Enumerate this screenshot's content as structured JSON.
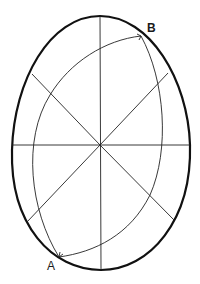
{
  "diagram": {
    "type": "egg-geometry",
    "labels": {
      "point_b": "B",
      "point_a": "A"
    },
    "colors": {
      "background": "#ffffff",
      "outline": "#111111",
      "construction": "#222222"
    },
    "center": [
      100,
      145
    ],
    "points": {
      "A": [
        59,
        257
      ],
      "B": [
        141,
        36
      ]
    }
  }
}
